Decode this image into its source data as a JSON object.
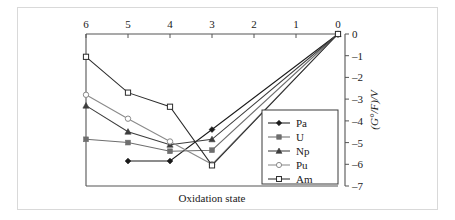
{
  "figure": {
    "background_color": "#ffffff",
    "frame_color": "#d9d9d9",
    "axis_color": "#555555"
  },
  "chart_data": {
    "type": "line",
    "title": "",
    "subtitle": "",
    "xlabel": "Oxidation state",
    "ylabel": "(G°/F)/V",
    "x_axis_position": "top",
    "y_axis_position": "right",
    "x_reversed": true,
    "xlim": [
      6,
      0
    ],
    "ylim": [
      -7,
      0
    ],
    "xticks": [
      6,
      5,
      4,
      3,
      2,
      1,
      0
    ],
    "xtick_labels": [
      "6",
      "5",
      "4",
      "3",
      "2",
      "1",
      "0"
    ],
    "yticks": [
      0,
      -1,
      -2,
      -3,
      -4,
      -5,
      -6,
      -7
    ],
    "ytick_labels": [
      "0",
      "–1",
      "–2",
      "–3",
      "–4",
      "–5",
      "–6",
      "–7"
    ],
    "grid": false,
    "legend_position": "inside-right",
    "series": [
      {
        "name": "Pa",
        "color": "#1a1a1a",
        "marker": "filled-diamond",
        "x": [
          5,
          4,
          3,
          0
        ],
        "values": [
          -5.85,
          -5.85,
          -4.4,
          0
        ]
      },
      {
        "name": "U",
        "color": "#6e6e6e",
        "marker": "filled-square",
        "x": [
          6,
          5,
          4,
          3,
          0
        ],
        "values": [
          -4.85,
          -5.0,
          -5.4,
          -5.35,
          0
        ]
      },
      {
        "name": "Np",
        "color": "#3d3d3d",
        "marker": "filled-triangle",
        "x": [
          6,
          5,
          4,
          3,
          0
        ],
        "values": [
          -3.3,
          -4.5,
          -5.1,
          -4.85,
          0
        ]
      },
      {
        "name": "Pu",
        "color": "#8a8a8a",
        "marker": "open-circle",
        "x": [
          6,
          5,
          4,
          3,
          0
        ],
        "values": [
          -2.8,
          -3.9,
          -4.95,
          -6.0,
          0
        ]
      },
      {
        "name": "Am",
        "color": "#2b2b2b",
        "marker": "open-square",
        "x": [
          6,
          5,
          4,
          3,
          0
        ],
        "values": [
          -1.05,
          -2.7,
          -3.35,
          -6.05,
          0
        ]
      }
    ]
  },
  "legend": {
    "entries": [
      {
        "label": "Pa"
      },
      {
        "label": "U"
      },
      {
        "label": "Np"
      },
      {
        "label": "Pu"
      },
      {
        "label": "Am"
      }
    ]
  },
  "axis": {
    "x_label": "Oxidation state",
    "y_label": "(G°/F)/V",
    "x_tick_labels": [
      "6",
      "5",
      "4",
      "3",
      "2",
      "1",
      "0"
    ],
    "y_tick_labels": [
      "0",
      "–1",
      "–2",
      "–3",
      "–4",
      "–5",
      "–6",
      "–7"
    ]
  }
}
